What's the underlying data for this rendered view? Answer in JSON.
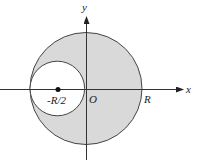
{
  "diagram": {
    "axes": {
      "x_label": "x",
      "y_label": "y",
      "origin_label": "O"
    },
    "labels": {
      "small_center": "-R/2",
      "big_radius": "R"
    },
    "colors": {
      "shaded_region": "#d9d9d9",
      "hole": "#ffffff",
      "stroke": "#444444"
    }
  }
}
